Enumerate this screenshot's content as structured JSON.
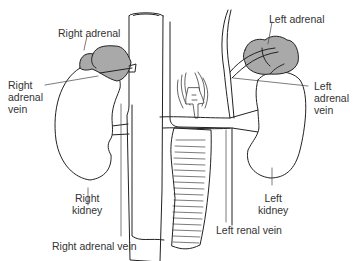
{
  "diagram": {
    "type": "anatomical-illustration",
    "colors": {
      "outline": "#222222",
      "gland_fill": "#a9a9a9",
      "background": "#ffffff",
      "text": "#333333"
    },
    "labels": {
      "right_adrenal": "Right adrenal",
      "right_adrenal_vein_side": "Right\nadrenal\nvein",
      "right_kidney": "Right\nkidney",
      "right_adrenal_vein_bottom": "Right adrenal vein",
      "left_adrenal": "Left adrenal",
      "left_adrenal_vein": "Left\nadrenal\nvein",
      "left_kidney": "Left\nkidney",
      "left_renal_vein": "Left renal vein"
    }
  }
}
